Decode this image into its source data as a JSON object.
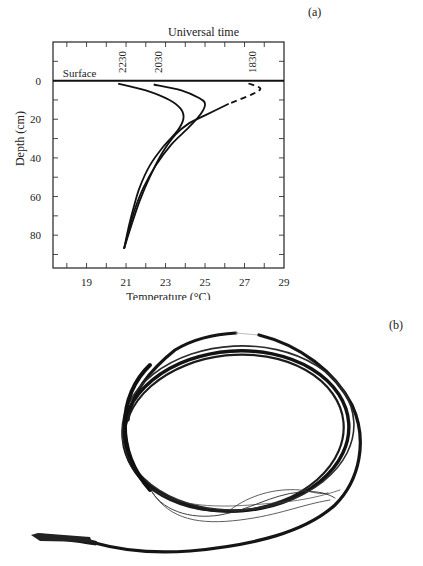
{
  "figure": {
    "panel_a_label": "(a)",
    "panel_b_label": "(b)",
    "photo_description": "Coiled thermocouple temperature probe cable with exposed lead wires and probe tip"
  },
  "chart_data": {
    "type": "line",
    "title": "Universal time",
    "xlabel": "Temperature (°C)",
    "ylabel": "Depth (cm)",
    "xlim": [
      17.3,
      29
    ],
    "ylim": [
      97,
      -20
    ],
    "x_ticks": [
      19,
      21,
      23,
      25,
      27,
      29
    ],
    "y_ticks": [
      0,
      20,
      40,
      60,
      80
    ],
    "grid": false,
    "annotations": [
      {
        "text": "Surface",
        "x": 17.8,
        "y": -3
      },
      {
        "text": "2230",
        "x": 20.8,
        "y": -5,
        "rotation": -90
      },
      {
        "text": "2030",
        "x": 22.6,
        "y": -5,
        "rotation": -90
      },
      {
        "text": "1830",
        "x": 27.4,
        "y": -5,
        "rotation": -90
      }
    ],
    "surface_line_depth": 0,
    "series": [
      {
        "name": "2230",
        "style": "solid",
        "points": [
          [
            20.6,
            1.5
          ],
          [
            22.0,
            5
          ],
          [
            23.2,
            10
          ],
          [
            23.8,
            15
          ],
          [
            23.9,
            20
          ],
          [
            23.6,
            26
          ],
          [
            22.9,
            34
          ],
          [
            22.2,
            44
          ],
          [
            21.7,
            55
          ],
          [
            21.4,
            65
          ],
          [
            21.15,
            75
          ],
          [
            20.9,
            87
          ]
        ]
      },
      {
        "name": "2030",
        "style": "solid",
        "points": [
          [
            22.4,
            2
          ],
          [
            23.8,
            5
          ],
          [
            24.7,
            9
          ],
          [
            25.0,
            12
          ],
          [
            24.8,
            17
          ],
          [
            24.2,
            24
          ],
          [
            23.3,
            33
          ],
          [
            22.5,
            44
          ],
          [
            21.9,
            55
          ],
          [
            21.5,
            65
          ],
          [
            21.2,
            75
          ],
          [
            20.9,
            87
          ]
        ]
      },
      {
        "name": "1830",
        "style": "dashed_then_solid",
        "dashed_until_depth": 12,
        "points": [
          [
            27.2,
            1.5
          ],
          [
            27.8,
            4
          ],
          [
            27.4,
            7
          ],
          [
            26.2,
            12
          ],
          [
            25.0,
            18
          ],
          [
            24.2,
            22
          ],
          [
            23.5,
            28
          ],
          [
            22.8,
            38
          ],
          [
            22.2,
            50
          ],
          [
            21.7,
            62
          ],
          [
            21.3,
            74
          ],
          [
            20.9,
            87
          ]
        ]
      }
    ]
  }
}
